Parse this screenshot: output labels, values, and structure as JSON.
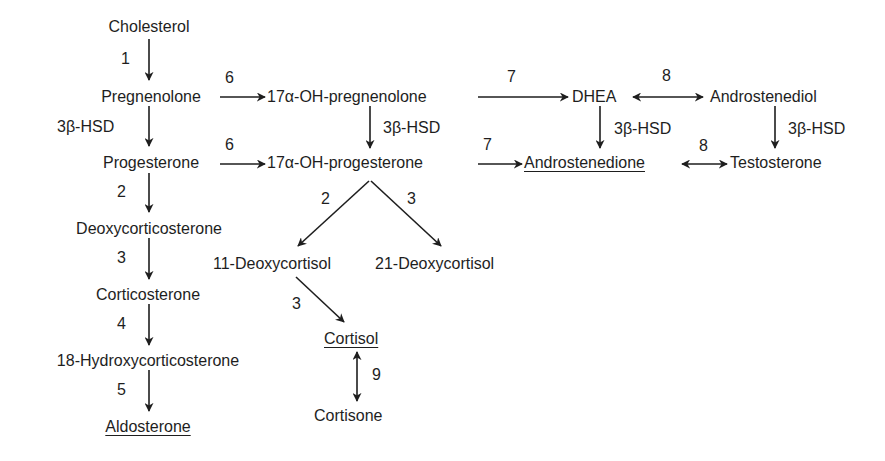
{
  "nodes": {
    "cholesterol": "Cholesterol",
    "pregnenolone": "Pregnenolone",
    "oh_pregnenolone": "17α-OH-pregnenolone",
    "dhea": "DHEA",
    "androstenediol": "Androstenediol",
    "progesterone": "Progesterone",
    "oh_progesterone": "17α-OH-progesterone",
    "androstenedione": "Androstenedione",
    "testosterone": "Testosterone",
    "deoxycorticosterone": "Deoxycorticosterone",
    "deoxycortisol_11": "11-Deoxycortisol",
    "deoxycortisol_21": "21-Deoxycortisol",
    "corticosterone": "Corticosterone",
    "cortisol": "Cortisol",
    "hydroxycorticosterone_18": "18-Hydroxycorticosterone",
    "aldosterone": "Aldosterone",
    "cortisone": "Cortisone"
  },
  "underlined": [
    "Androstenedione",
    "Cortisol",
    "Aldosterone"
  ],
  "edges": {
    "chol_preg": "1",
    "preg_prog": "3β-HSD",
    "preg_ohpreg": "6",
    "prog_ohprog": "6",
    "ohpreg_ohprog": "3β-HSD",
    "ohpreg_dhea": "7",
    "ohprog_andione": "7",
    "dhea_adiol": "8",
    "dhea_andione": "3β-HSD",
    "adiol_testo": "3β-HSD",
    "andione_testo": "8",
    "prog_doc": "2",
    "ohprog_11doc": "2",
    "ohprog_21doc": "3",
    "doc_cortico": "3",
    "11doc_cortisol": "3",
    "cortico_18oh": "4",
    "18oh_aldo": "5",
    "cortisol_cortisone": "9"
  },
  "colors": {
    "ink": "#1e1e1e",
    "background": "#ffffff"
  }
}
